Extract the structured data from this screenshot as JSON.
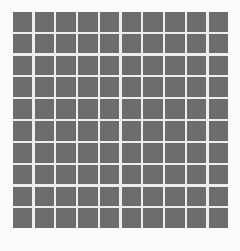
{
  "figure": {
    "kind": "grid-pattern",
    "title": "",
    "caption": ""
  },
  "chart_data": {
    "type": "heatmap",
    "title": "",
    "subtitle": "",
    "xlabel": "",
    "ylabel": "",
    "xticklabels": [],
    "yticklabels": [],
    "legend": [],
    "annotations": [],
    "grid": false,
    "rows": 10,
    "cols": 10,
    "cell_value": 1,
    "values": [
      [
        1,
        1,
        1,
        1,
        1,
        1,
        1,
        1,
        1,
        1
      ],
      [
        1,
        1,
        1,
        1,
        1,
        1,
        1,
        1,
        1,
        1
      ],
      [
        1,
        1,
        1,
        1,
        1,
        1,
        1,
        1,
        1,
        1
      ],
      [
        1,
        1,
        1,
        1,
        1,
        1,
        1,
        1,
        1,
        1
      ],
      [
        1,
        1,
        1,
        1,
        1,
        1,
        1,
        1,
        1,
        1
      ],
      [
        1,
        1,
        1,
        1,
        1,
        1,
        1,
        1,
        1,
        1
      ],
      [
        1,
        1,
        1,
        1,
        1,
        1,
        1,
        1,
        1,
        1
      ],
      [
        1,
        1,
        1,
        1,
        1,
        1,
        1,
        1,
        1,
        1
      ],
      [
        1,
        1,
        1,
        1,
        1,
        1,
        1,
        1,
        1,
        1
      ],
      [
        1,
        1,
        1,
        1,
        1,
        1,
        1,
        1,
        1,
        1
      ]
    ]
  },
  "style": {
    "cell_color": "#6b6b6b",
    "gap_color": "#ededed",
    "background_color": "#fbfbfb",
    "gap_px": 2.3,
    "grid_left_px": 13,
    "grid_top_px": 12,
    "grid_width_px": 215,
    "grid_height_px": 216
  }
}
